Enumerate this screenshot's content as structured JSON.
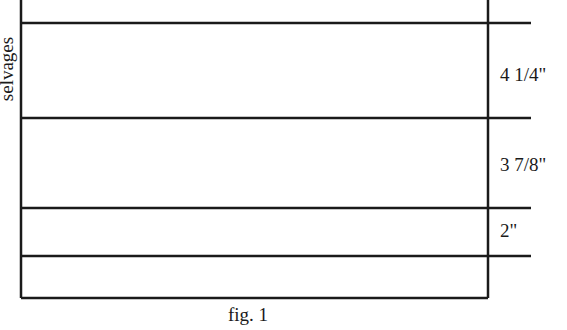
{
  "diagram": {
    "side_label": "selvages",
    "measurements": [
      {
        "label": "4 1/4\"",
        "y_top": 23,
        "y_bottom": 118
      },
      {
        "label": "3 7/8\"",
        "y_top": 118,
        "y_bottom": 208
      },
      {
        "label": "2\"",
        "y_top": 208,
        "y_bottom": 256
      }
    ],
    "caption": "fig. 1",
    "line_color": "#1a1a1a"
  }
}
